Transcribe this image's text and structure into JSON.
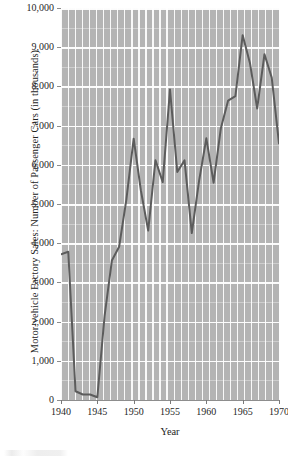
{
  "chart_data": {
    "type": "line",
    "title": "",
    "xlabel": "Year",
    "ylabel": "Motor-vehicle Factory Sales: Number of Passenger Cars (in thousands)",
    "xlim": [
      1940,
      1970
    ],
    "ylim": [
      0,
      10000
    ],
    "xticks": [
      1940,
      1945,
      1950,
      1955,
      1960,
      1965,
      1970
    ],
    "xtick_labels": [
      "1940",
      "1945",
      "1950",
      "1955",
      "1960",
      "1965",
      "1970"
    ],
    "yticks": [
      0,
      1000,
      2000,
      3000,
      4000,
      5000,
      6000,
      7000,
      8000,
      9000,
      10000
    ],
    "ytick_labels": [
      "0",
      "1,000",
      "2,000",
      "3,000",
      "4,000",
      "5,000",
      "6,000",
      "7,000",
      "8,000",
      "9,000",
      "10,000"
    ],
    "grid": true,
    "grid_style": "white gridlines on gray panel, vertical bands each year, horizontal major lines every 1,000 with minor lines every 500",
    "legend": false,
    "legend_position": "none",
    "line_color": "#5c5c5c",
    "line_width": 2.0,
    "plot_background": "#b4b4b4",
    "figure_background": "#ffffff",
    "x": [
      1940,
      1941,
      1942,
      1943,
      1944,
      1945,
      1946,
      1947,
      1948,
      1949,
      1950,
      1951,
      1952,
      1953,
      1954,
      1955,
      1956,
      1957,
      1958,
      1959,
      1960,
      1961,
      1962,
      1963,
      1964,
      1965,
      1966,
      1967,
      1968,
      1969,
      1970
    ],
    "values": [
      3717,
      3780,
      223,
      140,
      140,
      70,
      2149,
      3558,
      3909,
      5119,
      6666,
      5338,
      4321,
      6117,
      5559,
      7920,
      5816,
      6113,
      4258,
      5591,
      6675,
      5543,
      6933,
      7638,
      7752,
      9306,
      8598,
      7437,
      8822,
      8224,
      6547
    ],
    "units": "thousands of passenger cars",
    "source_note": ""
  },
  "axis_titles": {
    "y": "Motor-vehicle Factory Sales: Number of Passenger Cars (in thousands)",
    "x": "Year"
  }
}
